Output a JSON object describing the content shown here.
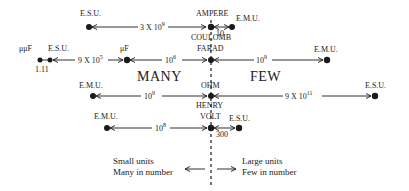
{
  "diagram": {
    "center_units": [
      {
        "name": "AMPERE",
        "alt": "COULOMB"
      },
      {
        "name": "FARAD"
      },
      {
        "name": "OHM",
        "alt": "HENRY"
      },
      {
        "name": "VOLT"
      }
    ],
    "rows": [
      {
        "id": "ampere",
        "left": {
          "unit": "E.S.U.",
          "factor_base": "3 X 10",
          "factor_exp": "9"
        },
        "center": "AMPERE",
        "center_below": "COULOMB",
        "right": {
          "unit": "E.M.U.",
          "factor_base": "10",
          "factor_exp": ""
        }
      },
      {
        "id": "farad",
        "far_left": {
          "unit": "μμF",
          "secondary_unit": "E.S.U.",
          "factor_base": "1.11",
          "factor_exp": ""
        },
        "left_mid": {
          "unit": "μF",
          "factor_base": "9 X 10",
          "factor_exp": "5"
        },
        "left": {
          "factor_base": "10",
          "factor_exp": "6"
        },
        "center": "FARAD",
        "right": {
          "unit": "E.M.U.",
          "factor_base": "10",
          "factor_exp": "9"
        }
      },
      {
        "id": "ohm",
        "left": {
          "unit": "E.M.U.",
          "factor_base": "10",
          "factor_exp": "9"
        },
        "center": "OHM",
        "center_below": "HENRY",
        "right": {
          "unit": "E.S.U.",
          "factor_base": "9 X 10",
          "factor_exp": "11"
        }
      },
      {
        "id": "volt",
        "left": {
          "unit": "E.M.U.",
          "factor_base": "10",
          "factor_exp": "8"
        },
        "center": "VOLT",
        "right": {
          "unit": "E.S.U.",
          "factor_base": "300",
          "factor_exp": ""
        }
      }
    ],
    "regions": {
      "left": "MANY",
      "right": "FEW"
    },
    "legend": {
      "left_line1": "Small units",
      "left_line2": "Many in number",
      "right_line1": "Large units",
      "right_line2": "Few in number"
    }
  }
}
